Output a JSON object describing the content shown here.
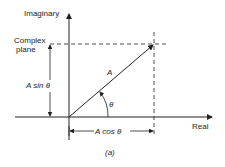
{
  "diagram": {
    "axis_labels": {
      "imaginary": "Imaginary",
      "real": "Real"
    },
    "plane_label_line1": "Complex",
    "plane_label_line2": "plane",
    "vector_label": "A",
    "angle_label": "θ",
    "vertical_component": "A sin θ",
    "horizontal_component": "A cos θ",
    "caption": "(a)"
  }
}
